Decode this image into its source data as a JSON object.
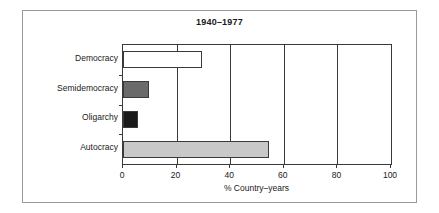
{
  "chart_data": {
    "type": "bar",
    "orientation": "horizontal",
    "title": "1940–1977",
    "xlabel": "% Country–years",
    "ylabel": "",
    "categories": [
      "Democracy",
      "Semidemocracy",
      "Oligarchy",
      "Autocracy"
    ],
    "values": [
      29.5,
      9.7,
      5.5,
      54.5
    ],
    "bar_colors": [
      "#ffffff",
      "#6a6a6a",
      "#1a1a1a",
      "#c8c8c8"
    ],
    "bar_edge_color": "#3a3a3a",
    "xlim": [
      0,
      100
    ],
    "xticks": [
      0,
      20,
      40,
      60,
      80,
      100
    ],
    "xticklabels": [
      "0",
      "20",
      "40",
      "60",
      "80",
      "100"
    ],
    "grid": true,
    "grid_axis": "x",
    "legend": null,
    "legend_position": "none",
    "frame": true
  },
  "figure": {
    "background_color": "#ffffff",
    "frame_color": "#9a9a9a",
    "axis_color": "#3a3a3a",
    "text_color": "#1a1a1a"
  }
}
